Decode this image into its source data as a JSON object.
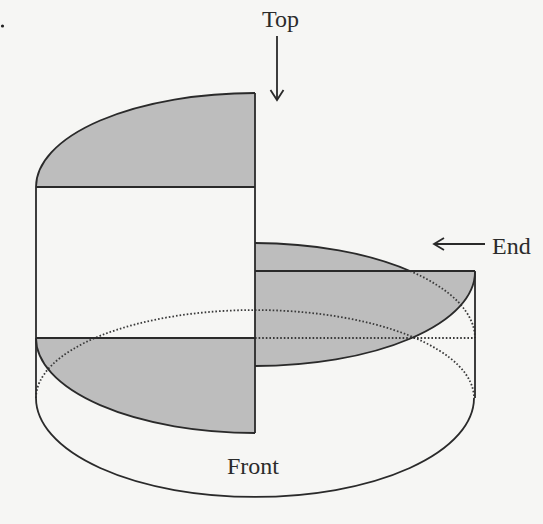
{
  "diagram": {
    "labels": {
      "top": "Top",
      "end": "End",
      "front": "Front"
    },
    "arrows": [
      {
        "label": "Top",
        "direction": "down"
      },
      {
        "label": "End",
        "direction": "left"
      }
    ],
    "views": [
      {
        "name": "top-view",
        "shape": "quarter-ellipse segment",
        "fill": "gray"
      },
      {
        "name": "front-view",
        "shape": "rectangle with quarter-ellipse segment",
        "fill": "gray"
      },
      {
        "name": "end-view",
        "shape": "quarter-ellipse segment over rectangle",
        "fill": "gray"
      }
    ],
    "colors": {
      "background": "#f6f6f4",
      "fill": "#bdbdbd",
      "stroke": "#2a2a2a",
      "white_face": "#f6f6f4"
    }
  }
}
